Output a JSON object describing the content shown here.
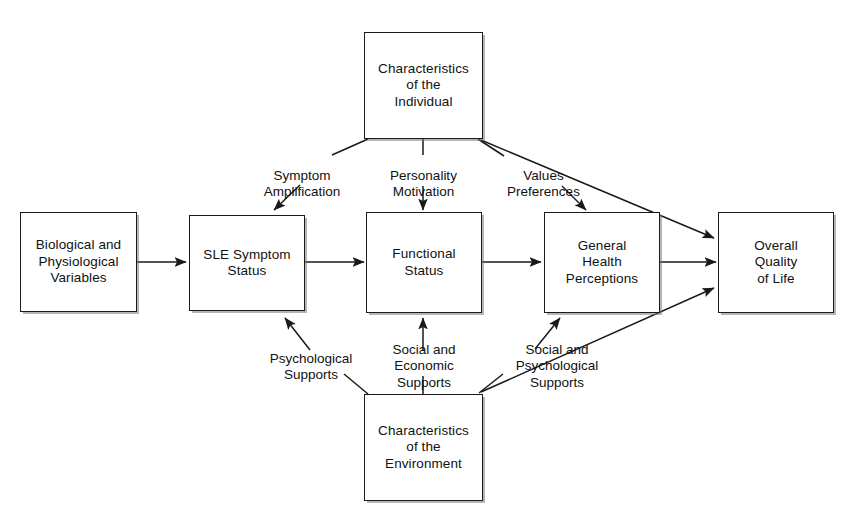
{
  "diagram": {
    "nodes": [
      {
        "id": "biological",
        "label": "Biological and\nPhysiological\nVariables"
      },
      {
        "id": "sle",
        "label": "SLE Symptom\nStatus"
      },
      {
        "id": "functional",
        "label": "Functional\nStatus"
      },
      {
        "id": "perceptions",
        "label": "General\nHealth\nPerceptions"
      },
      {
        "id": "quality",
        "label": "Overall\nQuality\nof Life"
      },
      {
        "id": "individual",
        "label": "Characteristics\nof the\nIndividual"
      },
      {
        "id": "environment",
        "label": "Characteristics\nof the\nEnvironment"
      }
    ],
    "edge_labels": [
      {
        "id": "symptom-amplification",
        "label": "Symptom\nAmplification"
      },
      {
        "id": "personality-motivation",
        "label": "Personality\nMotivation"
      },
      {
        "id": "values-preferences",
        "label": "Values\nPreferences"
      },
      {
        "id": "psychological-supports",
        "label": "Psychological\nSupports"
      },
      {
        "id": "social-economic-supports",
        "label": "Social and\nEconomic\nSupports"
      },
      {
        "id": "social-psychological-supports",
        "label": "Social and\nPsychological\nSupports"
      }
    ],
    "colors": {
      "stroke": "#1a1a1a",
      "background": "#ffffff",
      "text": "#111111"
    }
  }
}
